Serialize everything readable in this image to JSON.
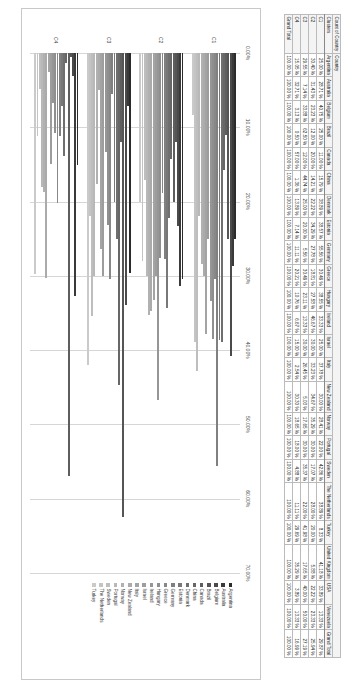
{
  "pivot": {
    "title_cell": "Count of Country",
    "title_value": "Country",
    "row_header": "Clusters",
    "columns": [
      "Argentina",
      "Australia",
      "Belgium",
      "Brazil",
      "Canada",
      "China",
      "Denmark",
      "Estonia",
      "Germany",
      "Greece",
      "Hungary",
      "Ireland",
      "Israel",
      "Italy",
      "New Zealand",
      "Norway",
      "Portugal",
      "Sweden",
      "The Netherlands",
      "Turkey",
      "United Kingdom",
      "USA",
      "Venezuela",
      "Grand Total"
    ],
    "rows": [
      {
        "label": "C1",
        "values": [
          "25.00 %",
          "28.71 %",
          "40.75 %",
          "25.00 %",
          "11.00 %",
          "15.79 %",
          "38.89 %",
          "38.57 %",
          "55.56 %",
          "30.49 %",
          "38.55 %",
          "33.33 %",
          "25.00 %",
          "37.78 %",
          "30.00 %",
          "28.41 %",
          "22.00 %",
          "42.86 %",
          "38.89 %",
          "8.33 %",
          "41.18 %",
          "33.89 %",
          "13.33 %",
          "29.87 %"
        ]
      },
      {
        "label": "C2",
        "values": [
          "30.40 %",
          "31.43 %",
          "23.23 %",
          "12.00 %",
          "20.00 %",
          "14.21 %",
          "22.22 %",
          "34.29 %",
          "27.78 %",
          "18.81 %",
          "27.58 %",
          "46.67 %",
          "30.00 %",
          "33.23 %",
          "34.67 %",
          "35.29 %",
          "30.00 %",
          "17.07 %",
          "28.00 %",
          "20.00 %",
          "5.88 %",
          "22.22 %",
          "23.33 %",
          "25.94 %"
        ]
      },
      {
        "label": "C3",
        "values": [
          "29.55 %",
          "7.14 %",
          "33.88 %",
          "62.50 %",
          "12.00 %",
          "44.74 %",
          "25.00 %",
          "20.00 %",
          "5.56 %",
          "30.49 %",
          "23.11 %",
          "13.33 %",
          "30.00 %",
          "26.45 %",
          "5.03 %",
          "17.65 %",
          "30.00 %",
          "35.37 %",
          "22.00 %",
          "41.98 %",
          "17.65 %",
          "40.00 %",
          "50.00 %",
          "27.19 %"
        ]
      },
      {
        "label": "C4",
        "values": [
          "15.05 %",
          "32.71 %",
          "3.13 %",
          "0.50 %",
          "57.00 %",
          "1.36 %",
          "13.89 %",
          "7.14 %",
          "11.11 %",
          "20.21 %",
          "10.76 %",
          "6.67 %",
          "15.00 %",
          "2.54 %",
          "30.30 %",
          "18.65 %",
          "18.00 %",
          "4.88 %",
          "11.11 %",
          "29.69 %",
          "35.29 %",
          "3.89 %",
          "13.33 %",
          "16.99 %"
        ]
      }
    ],
    "total_row": {
      "label": "Grand Total",
      "values": [
        "100.00 %",
        "100.00 %",
        "100.00 %",
        "100.00 %",
        "100.00 %",
        "100.00 %",
        "100.00 %",
        "100.00 %",
        "100.00 %",
        "100.00 %",
        "100.00 %",
        "100.00 %",
        "100.00 %",
        "100.00 %",
        "100.00 %",
        "100.00 %",
        "100.00 %",
        "100.00 %",
        "100.00 %",
        "100.00 %",
        "100.00 %",
        "100.00 %",
        "100.00 %",
        "100.00 %"
      ]
    }
  },
  "chart_data": {
    "type": "bar",
    "orientation": "horizontal",
    "title": "",
    "xlabel": "",
    "ylabel": "",
    "categories": [
      "C1",
      "C2",
      "C3",
      "C4"
    ],
    "xlim": [
      0,
      70
    ],
    "x_ticks": [
      "0.00%",
      "10.00%",
      "20.00%",
      "30.00%",
      "40.00%",
      "50.00%",
      "60.00%",
      "70.00%"
    ],
    "grid": true,
    "legend_position": "right",
    "series": [
      {
        "name": "Argentina",
        "values": [
          25.0,
          30.4,
          29.55,
          15.05
        ]
      },
      {
        "name": "Australia",
        "values": [
          28.71,
          31.43,
          7.14,
          32.71
        ]
      },
      {
        "name": "Belgium",
        "values": [
          40.75,
          23.23,
          33.88,
          3.13
        ]
      },
      {
        "name": "Brazil",
        "values": [
          25.0,
          12.0,
          62.5,
          0.5
        ]
      },
      {
        "name": "Canada",
        "values": [
          11.0,
          20.0,
          12.0,
          57.0
        ]
      },
      {
        "name": "China",
        "values": [
          15.79,
          14.21,
          44.74,
          1.36
        ]
      },
      {
        "name": "Denmark",
        "values": [
          38.89,
          22.22,
          25.0,
          13.89
        ]
      },
      {
        "name": "Estonia",
        "values": [
          38.57,
          34.29,
          20.0,
          7.14
        ]
      },
      {
        "name": "Germany",
        "values": [
          55.56,
          27.78,
          5.56,
          11.11
        ]
      },
      {
        "name": "Greece",
        "values": [
          30.49,
          18.81,
          30.49,
          20.21
        ]
      },
      {
        "name": "Hungary",
        "values": [
          38.55,
          27.58,
          23.11,
          10.76
        ]
      },
      {
        "name": "Ireland",
        "values": [
          33.33,
          46.67,
          13.33,
          6.67
        ]
      },
      {
        "name": "Israel",
        "values": [
          25.0,
          30.0,
          30.0,
          15.0
        ]
      },
      {
        "name": "Italy",
        "values": [
          37.78,
          33.23,
          26.45,
          2.54
        ]
      },
      {
        "name": "New Zealand",
        "values": [
          30.0,
          34.67,
          5.03,
          30.3
        ]
      },
      {
        "name": "Norway",
        "values": [
          28.41,
          35.29,
          17.65,
          18.65
        ]
      },
      {
        "name": "Portugal",
        "values": [
          22.0,
          30.0,
          30.0,
          18.0
        ]
      },
      {
        "name": "Sweden",
        "values": [
          42.86,
          17.07,
          35.37,
          4.88
        ]
      },
      {
        "name": "The Netherlands",
        "values": [
          38.89,
          28.0,
          22.0,
          11.11
        ]
      },
      {
        "name": "Turkey",
        "values": [
          8.33,
          20.0,
          41.98,
          29.69
        ]
      }
    ],
    "series_colors": [
      "#2b2b2b",
      "#3a3a3a",
      "#4a4a4a",
      "#555555",
      "#5e5e5e",
      "#676767",
      "#6f6f6f",
      "#787878",
      "#808080",
      "#888888",
      "#8f8f8f",
      "#969696",
      "#9d9d9d",
      "#a4a4a4",
      "#ababab",
      "#b1b1b1",
      "#b8b8b8",
      "#bebebe",
      "#c4c4c4",
      "#cacaca"
    ]
  }
}
